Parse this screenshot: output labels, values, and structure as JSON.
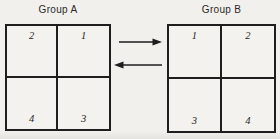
{
  "figure": {
    "colors": {
      "background": "#f2f0ed",
      "line": "#1e1e1e",
      "text": "#2b2a28"
    }
  },
  "group_a": {
    "title": "Group A",
    "cells": {
      "top_left": "2",
      "top_right": "1",
      "bottom_left": "4",
      "bottom_right": "3"
    }
  },
  "group_b": {
    "title": "Group B",
    "cells": {
      "top_left": "1",
      "top_right": "2",
      "bottom_left": "3",
      "bottom_right": "4"
    }
  },
  "arrows": {
    "top_direction": "right",
    "bottom_direction": "left"
  }
}
